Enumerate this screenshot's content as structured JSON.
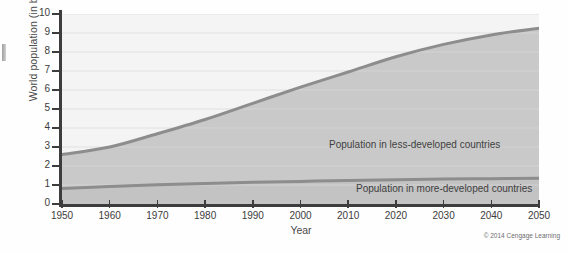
{
  "chart_data": {
    "type": "area",
    "title": "",
    "xlabel": "Year",
    "ylabel": "World population (in billions)",
    "xlim": [
      1950,
      2050
    ],
    "ylim": [
      0,
      10
    ],
    "grid": true,
    "legend_position": "inline-annotations",
    "x_ticks": [
      "1950",
      "1960",
      "1970",
      "1980",
      "1990",
      "2000",
      "2010",
      "2020",
      "2030",
      "2040",
      "2050"
    ],
    "y_ticks": [
      "0",
      "1",
      "2",
      "3",
      "4",
      "5",
      "6",
      "7",
      "8",
      "9",
      "10"
    ],
    "x": [
      1950,
      1960,
      1970,
      1980,
      1990,
      2000,
      2010,
      2020,
      2030,
      2040,
      2050
    ],
    "series": [
      {
        "name": "Population in more-developed countries",
        "values": [
          0.81,
          0.92,
          1.01,
          1.08,
          1.14,
          1.19,
          1.24,
          1.28,
          1.31,
          1.33,
          1.35
        ]
      },
      {
        "name": "Total world population (top of less-developed band)",
        "values": [
          2.6,
          3.0,
          3.7,
          4.45,
          5.3,
          6.15,
          6.95,
          7.75,
          8.4,
          8.9,
          9.25
        ]
      }
    ],
    "annotations": [
      {
        "text": "Population in less-developed countries",
        "x": 2008,
        "y": 3.6
      },
      {
        "text": "Population in more-developed countries",
        "x": 2014,
        "y": 1.0
      }
    ],
    "colors": {
      "upper_band_fill": "#f4f4f4",
      "less_developed_band_fill": "#c9c9c9",
      "more_developed_band_fill": "#c3c3c3",
      "curve_stroke": "#8d8d8d",
      "axis": "#3d3d3d",
      "gridline": "#d9d9d9",
      "text": "#3c3c3c"
    }
  },
  "credit": {
    "text": "© 2014 Cengage Learning"
  }
}
